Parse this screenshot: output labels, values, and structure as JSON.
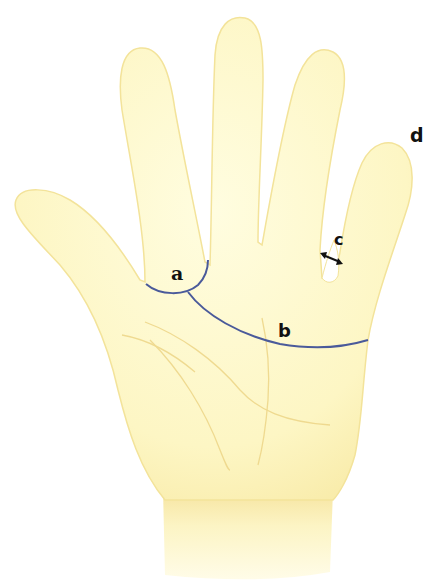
{
  "figure": {
    "type": "anatomical-diagram",
    "colors": {
      "skin_fill": "#fdf8c8",
      "skin_edge": "#f5e8a0",
      "crease_line": "#eed78a",
      "measurement_line": "#4a5a9a",
      "label_text": "#111111",
      "background": "#ffffff"
    },
    "labels": {
      "a": "a",
      "b": "b",
      "c": "c",
      "d": "d"
    },
    "annotations": [
      {
        "id": "a",
        "description": "arc across base of index finger"
      },
      {
        "id": "b",
        "description": "curved line across palm from index finger base to little finger side"
      },
      {
        "id": "c",
        "description": "double-headed arrow across gap between ring and little fingers"
      },
      {
        "id": "d",
        "description": "label at tip of little finger"
      }
    ],
    "arrow_symbol": "↔"
  }
}
